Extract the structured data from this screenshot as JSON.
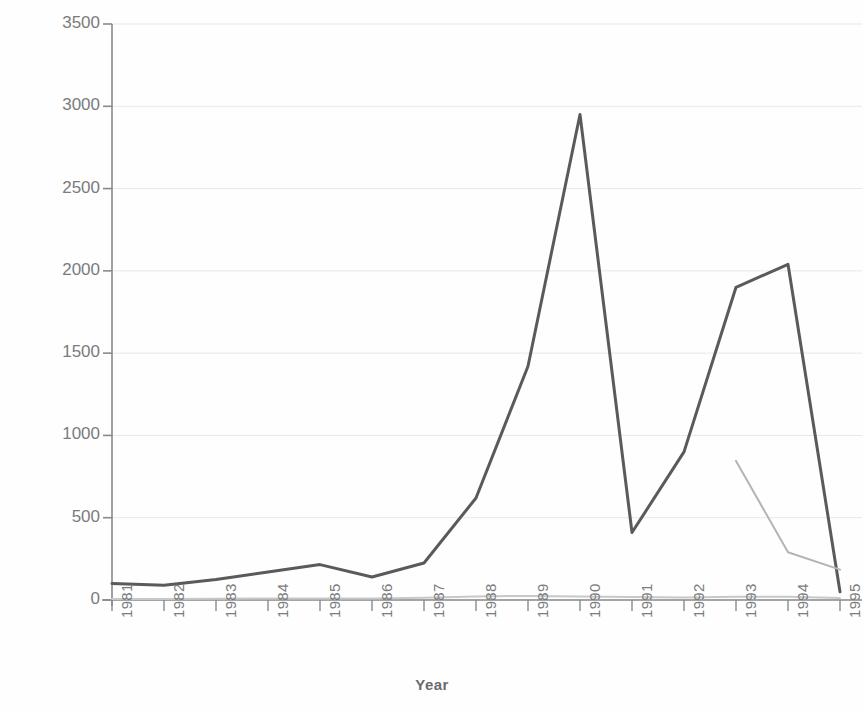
{
  "chart_data": {
    "type": "line",
    "title": "",
    "xlabel": "Year",
    "ylabel": "Inflation Rate (%)",
    "categories": [
      "1981",
      "1982",
      "1983",
      "1984",
      "1985",
      "1986",
      "1987",
      "1988",
      "1989",
      "1990",
      "1991",
      "1992",
      "1993",
      "1994",
      "1995"
    ],
    "x": [
      1981,
      1982,
      1983,
      1984,
      1985,
      1986,
      1987,
      1988,
      1989,
      1990,
      1991,
      1992,
      1993,
      1994,
      1995
    ],
    "xlim": [
      1981,
      1995
    ],
    "ylim": [
      0,
      3500
    ],
    "yticks": [
      0,
      500,
      1000,
      1500,
      2000,
      2500,
      3000,
      3500
    ],
    "ytick_labels": [
      "0",
      "500",
      "1000",
      "1500",
      "2000",
      "2500",
      "3000",
      "3500"
    ],
    "xtick_labels": [
      "1981",
      "1982",
      "1983",
      "1984",
      "1985",
      "1986",
      "1987",
      "1988",
      "1989",
      "1990",
      "1991",
      "1992",
      "1993",
      "1994",
      "1995"
    ],
    "grid": true,
    "grid_axis": "y",
    "legend": "none",
    "series": [
      {
        "name": "series-1",
        "color": "#5a5a5a",
        "width": 3,
        "x": [
          1981,
          1982,
          1983,
          1984,
          1985,
          1986,
          1987,
          1988,
          1989,
          1990,
          1991,
          1992,
          1993,
          1994,
          1995
        ],
        "values": [
          100,
          90,
          125,
          170,
          215,
          140,
          225,
          620,
          1420,
          2950,
          410,
          900,
          1900,
          2040,
          50
        ]
      },
      {
        "name": "series-2",
        "color": "#b4b4b4",
        "width": 2,
        "x": [
          1993,
          1994,
          1995
        ],
        "values": [
          845,
          290,
          185
        ]
      },
      {
        "name": "series-3",
        "color": "#c8c8c8",
        "width": 2,
        "x": [
          1981,
          1982,
          1983,
          1984,
          1985,
          1986,
          1987,
          1988,
          1989,
          1990,
          1991,
          1992,
          1993,
          1994,
          1995
        ],
        "values": [
          6,
          6,
          8,
          9,
          10,
          10,
          14,
          22,
          25,
          22,
          18,
          16,
          20,
          20,
          12
        ]
      }
    ]
  },
  "axes": {
    "y_title": "Inflation Rate (%)",
    "x_title": "Year",
    "y_tick_labels": [
      "3500",
      "3000",
      "2500",
      "2000",
      "1500",
      "1000",
      "500",
      "0"
    ],
    "x_tick_labels": [
      "1981",
      "1982",
      "1983",
      "1984",
      "1985",
      "1986",
      "1987",
      "1988",
      "1989",
      "1990",
      "1991",
      "1992",
      "1993",
      "1994",
      "1995"
    ]
  },
  "colors": {
    "line_primary": "#5a5a5a",
    "line_secondary": "#b4b4b4",
    "line_tertiary": "#c8c8c8",
    "axis": "#8a8a8a",
    "grid": "#e8e8e8",
    "text": "#7a7b7d",
    "background": "#ffffff"
  }
}
